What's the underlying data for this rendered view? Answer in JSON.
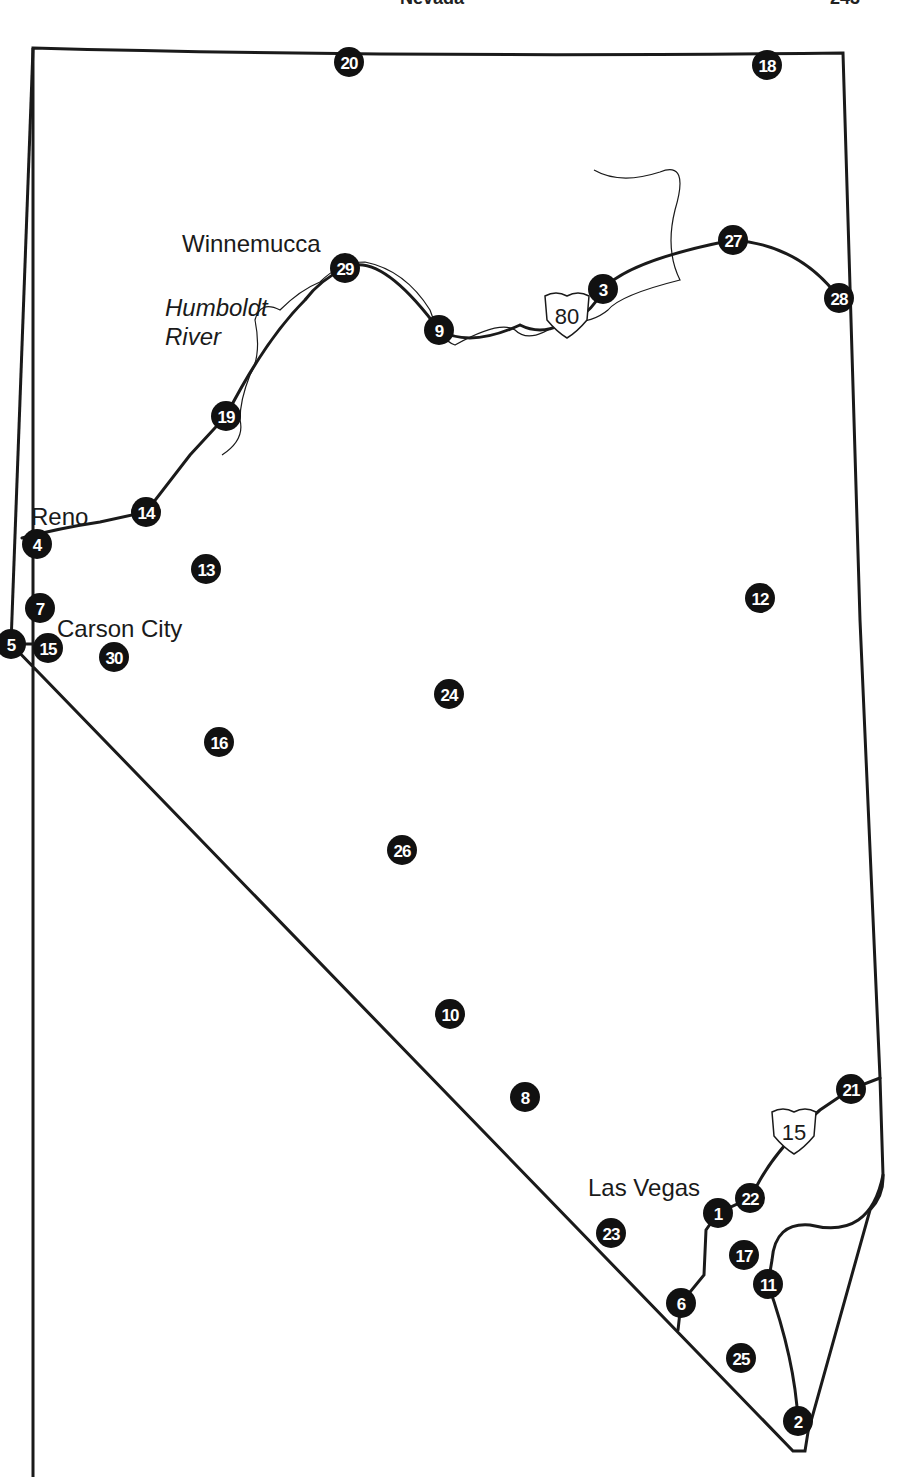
{
  "page": {
    "running_header": "Nevada",
    "page_number": "243"
  },
  "map": {
    "state": "Nevada",
    "colors": {
      "ink": "#111111",
      "background": "#ffffff",
      "marker_text": "#ffffff"
    },
    "cities": [
      {
        "id": "winnemucca",
        "label": "Winnemucca",
        "x": 182,
        "y": 252
      },
      {
        "id": "reno",
        "label": "Reno",
        "x": 31,
        "y": 525
      },
      {
        "id": "carson-city",
        "label": "Carson City",
        "x": 57,
        "y": 637
      },
      {
        "id": "las-vegas",
        "label": "Las Vegas",
        "x": 588,
        "y": 1196
      }
    ],
    "river": {
      "label_line1": "Humboldt",
      "label_line2": "River"
    },
    "interstates": [
      {
        "id": "i80",
        "number": "80",
        "x": 567,
        "y": 312
      },
      {
        "id": "i15",
        "number": "15",
        "x": 794,
        "y": 1128
      }
    ],
    "markers": [
      {
        "n": "1",
        "x": 718,
        "y": 1213
      },
      {
        "n": "2",
        "x": 798,
        "y": 1421
      },
      {
        "n": "3",
        "x": 603,
        "y": 289
      },
      {
        "n": "4",
        "x": 37,
        "y": 544
      },
      {
        "n": "5",
        "x": 11,
        "y": 644
      },
      {
        "n": "6",
        "x": 681,
        "y": 1303
      },
      {
        "n": "7",
        "x": 40,
        "y": 608
      },
      {
        "n": "8",
        "x": 525,
        "y": 1097
      },
      {
        "n": "9",
        "x": 439,
        "y": 330
      },
      {
        "n": "10",
        "x": 450,
        "y": 1014
      },
      {
        "n": "11",
        "x": 768,
        "y": 1284
      },
      {
        "n": "12",
        "x": 760,
        "y": 598
      },
      {
        "n": "13",
        "x": 206,
        "y": 569
      },
      {
        "n": "14",
        "x": 146,
        "y": 512
      },
      {
        "n": "15",
        "x": 48,
        "y": 648
      },
      {
        "n": "16",
        "x": 219,
        "y": 742
      },
      {
        "n": "17",
        "x": 744,
        "y": 1255
      },
      {
        "n": "18",
        "x": 767,
        "y": 65
      },
      {
        "n": "19",
        "x": 226,
        "y": 416
      },
      {
        "n": "20",
        "x": 349,
        "y": 62
      },
      {
        "n": "21",
        "x": 851,
        "y": 1089
      },
      {
        "n": "22",
        "x": 750,
        "y": 1198
      },
      {
        "n": "23",
        "x": 611,
        "y": 1233
      },
      {
        "n": "24",
        "x": 449,
        "y": 694
      },
      {
        "n": "25",
        "x": 741,
        "y": 1358
      },
      {
        "n": "26",
        "x": 402,
        "y": 850
      },
      {
        "n": "27",
        "x": 733,
        "y": 240
      },
      {
        "n": "28",
        "x": 839,
        "y": 298
      },
      {
        "n": "29",
        "x": 345,
        "y": 268
      },
      {
        "n": "30",
        "x": 114,
        "y": 657
      }
    ]
  }
}
